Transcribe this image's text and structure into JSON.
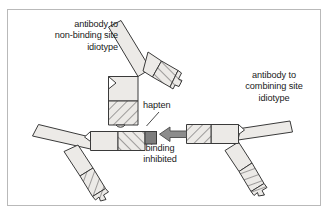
{
  "figure": {
    "background_color": "#ffffff",
    "frame_color": "#b9b9b9"
  },
  "labels": {
    "non_binding_idiotype": "antibody to\nnon-binding site\nidiotype",
    "combining_site_idiotype": "antibody to\ncombining site\nidiotype",
    "hapten": "hapten",
    "binding_inhibited": "binding\ninhibited"
  },
  "elements": {
    "antibody_top_name": "antibody-non-binding-site-idiotype",
    "antibody_left_name": "antibody-central",
    "antibody_right_name": "antibody-combining-site-idiotype",
    "hapten_name": "hapten-square",
    "arrow_name": "binding-inhibited-arrow",
    "leader_name": "hapten-leader-line"
  },
  "colors": {
    "arm_fill": "#eceae7",
    "outline": "#3a3a3a",
    "hatch_line": "#3a3a3a",
    "hapten_fill": "#7d7d7d",
    "arrow_fill": "#8c8c8c",
    "arrow_outline": "#4a4a4a",
    "text": "#1a1a1a"
  }
}
